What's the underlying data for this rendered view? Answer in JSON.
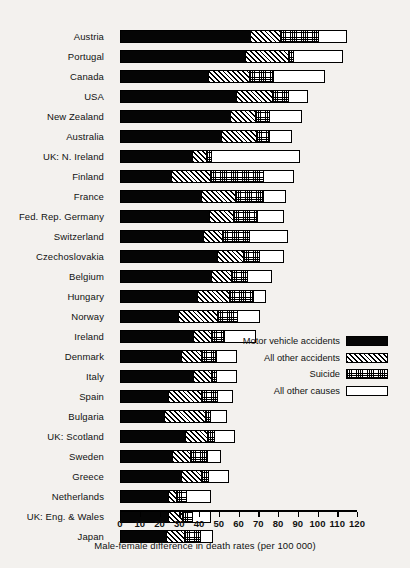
{
  "chart_data": {
    "type": "bar",
    "orientation": "horizontal",
    "stacked": true,
    "title": "",
    "xlabel": "Male-female difference in death rates (per 100 000)",
    "ylabel": "",
    "xlim": [
      0,
      120
    ],
    "xticks": [
      0,
      10,
      20,
      30,
      40,
      50,
      60,
      70,
      80,
      90,
      100,
      110,
      120
    ],
    "grid": false,
    "legend_position": "inside-right",
    "categories": [
      "Austria",
      "Portugal",
      "Canada",
      "USA",
      "New Zealand",
      "Australia",
      "UK: N. Ireland",
      "Finland",
      "France",
      "Fed. Rep. Germany",
      "Switzerland",
      "Czechoslovakia",
      "Belgium",
      "Hungary",
      "Norway",
      "Ireland",
      "Denmark",
      "Italy",
      "Spain",
      "Bulgaria",
      "UK: Scotland",
      "Sweden",
      "Greece",
      "Netherlands",
      "UK: Eng. & Wales",
      "Japan"
    ],
    "series": [
      {
        "name": "Motor vehicle accidents",
        "pattern": "solid-black",
        "values": [
          67,
          64,
          45,
          60,
          57,
          52,
          37,
          26,
          42,
          46,
          43,
          50,
          47,
          40,
          30,
          38,
          32,
          38,
          25,
          23,
          34,
          27,
          32,
          25,
          25,
          24
        ]
      },
      {
        "name": "All other accidents",
        "pattern": "diagonal-hatch",
        "values": [
          15,
          22,
          21,
          18,
          12,
          18,
          7,
          20,
          17,
          12,
          9,
          13,
          10,
          16,
          20,
          9,
          10,
          9,
          17,
          21,
          11,
          9,
          10,
          4,
          7,
          9
        ]
      },
      {
        "name": "Suicide",
        "pattern": "dotted-stipple",
        "values": [
          19,
          2,
          12,
          8,
          7,
          6,
          2,
          27,
          14,
          12,
          14,
          8,
          8,
          12,
          10,
          6,
          7,
          2,
          8,
          2,
          3,
          9,
          3,
          5,
          5,
          8
        ]
      },
      {
        "name": "All other causes",
        "pattern": "white",
        "values": [
          14,
          25,
          26,
          9,
          16,
          11,
          45,
          15,
          11,
          13,
          19,
          12,
          12,
          6,
          11,
          16,
          10,
          10,
          7,
          8,
          10,
          6,
          10,
          12,
          9,
          6
        ]
      }
    ],
    "totals": [
      115,
      113,
      104,
      95,
      92,
      87,
      91,
      88,
      84,
      83,
      85,
      83,
      77,
      74,
      71,
      69,
      59,
      59,
      57,
      54,
      58,
      51,
      55,
      46,
      46,
      47
    ]
  },
  "legend": {
    "items": [
      {
        "label": "Motor vehicle accidents",
        "swatch": "solid-black"
      },
      {
        "label": "All other accidents",
        "swatch": "diagonal-hatch"
      },
      {
        "label": "Suicide",
        "swatch": "dotted-stipple"
      },
      {
        "label": "All other causes",
        "swatch": "white"
      }
    ]
  }
}
